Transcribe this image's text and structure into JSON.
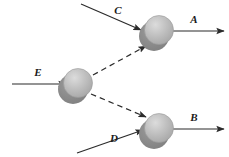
{
  "figure": {
    "background_color": "#ffffff",
    "line_color": "#2b2b2b",
    "label_color": "#1a1a1a"
  },
  "nodes": [
    {
      "id": "node-e",
      "name": "center-node",
      "cx": 78,
      "cy": 84,
      "r": 15,
      "face_color": "#b3b3b3",
      "shadow_color": "#8a8a8a",
      "highlight_color": "#d4d4d4"
    },
    {
      "id": "node-top",
      "name": "top-node",
      "cx": 159,
      "cy": 31,
      "r": 15,
      "face_color": "#b3b3b3",
      "shadow_color": "#8a8a8a",
      "highlight_color": "#d4d4d4"
    },
    {
      "id": "node-bottom",
      "name": "bottom-node",
      "cx": 159,
      "cy": 129,
      "r": 15,
      "face_color": "#b3b3b3",
      "shadow_color": "#8a8a8a",
      "highlight_color": "#d4d4d4"
    }
  ],
  "arrows": [
    {
      "id": "arrow-e",
      "name": "arrow-e",
      "label": "E",
      "style": "solid",
      "x1": 12,
      "y1": 84,
      "x2": 66,
      "y2": 84,
      "label_x": 38,
      "label_y": 76
    },
    {
      "id": "arrow-c",
      "name": "arrow-c",
      "label": "C",
      "style": "solid",
      "x1": 81,
      "y1": 4,
      "x2": 143,
      "y2": 31,
      "label_x": 118,
      "label_y": 13
    },
    {
      "id": "arrow-d",
      "name": "arrow-d",
      "label": "D",
      "style": "solid",
      "x1": 77,
      "y1": 153,
      "x2": 144,
      "y2": 130,
      "label_x": 114,
      "label_y": 141
    },
    {
      "id": "arrow-a",
      "name": "arrow-a",
      "label": "A",
      "style": "solid",
      "x1": 173,
      "y1": 31,
      "x2": 224,
      "y2": 31,
      "label_x": 194,
      "label_y": 23
    },
    {
      "id": "arrow-b",
      "name": "arrow-b",
      "label": "B",
      "style": "solid",
      "x1": 173,
      "y1": 129,
      "x2": 224,
      "y2": 129,
      "label_x": 194,
      "label_y": 121
    },
    {
      "id": "arrow-branch-up",
      "name": "arrow-branch-up",
      "label": "",
      "style": "dashed",
      "x1": 93,
      "y1": 75,
      "x2": 146,
      "y2": 46,
      "label_x": 0,
      "label_y": 0
    },
    {
      "id": "arrow-branch-down",
      "name": "arrow-branch-down",
      "label": "",
      "style": "dashed",
      "x1": 91,
      "y1": 94,
      "x2": 146,
      "y2": 117,
      "label_x": 0,
      "label_y": 0
    }
  ],
  "labels": {
    "a": "A",
    "b": "B",
    "c": "C",
    "d": "D",
    "e": "E"
  }
}
